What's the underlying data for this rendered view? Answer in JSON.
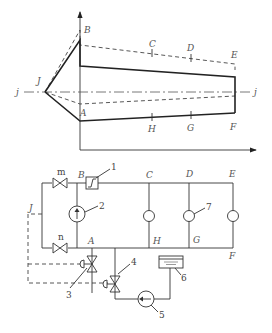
{
  "pressure_diagram": {
    "labels": {
      "B": "B",
      "C": "C",
      "D": "D",
      "E": "E",
      "A": "A",
      "H": "H",
      "G": "G",
      "F": "F",
      "J": "J",
      "j_left": "j",
      "j_right": "j"
    }
  },
  "circuit": {
    "labels": {
      "m": "m",
      "n": "n",
      "B": "B",
      "C": "C",
      "D": "D",
      "E": "E",
      "A": "A",
      "H": "H",
      "G": "G",
      "F": "F",
      "J": "J"
    },
    "components": {
      "c1": "1",
      "c2": "2",
      "c3": "3",
      "c4": "4",
      "c5": "5",
      "c6": "6",
      "c7": "7"
    },
    "colors": {
      "line": "#333333",
      "background": "#ffffff"
    }
  }
}
